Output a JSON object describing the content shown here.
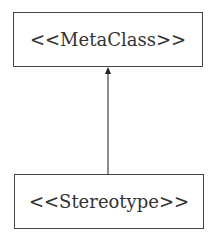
{
  "diagram": {
    "nodes": [
      {
        "id": "metaclass",
        "label": "<<MetaClass>>"
      },
      {
        "id": "stereotype",
        "label": "<<Stereotype>>"
      }
    ],
    "edges": [
      {
        "from": "stereotype",
        "to": "metaclass",
        "arrow": "filled-triangle"
      }
    ]
  }
}
